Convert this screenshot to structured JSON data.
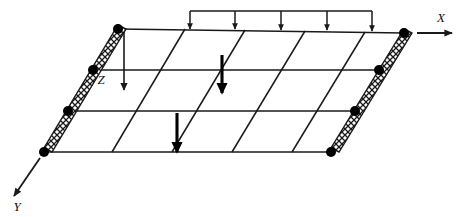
{
  "figure": {
    "background_color": "#ffffff",
    "line_color": "#1a1a1a",
    "node_color": "#000000"
  },
  "axes": [
    {
      "name": "x-axis",
      "label": "X",
      "label_x": 441,
      "label_y": 22,
      "arrow_from": [
        417,
        33
      ],
      "arrow_to": [
        452,
        33
      ],
      "direction": "right"
    },
    {
      "name": "y-axis",
      "label": "Y",
      "label_x": 17,
      "label_y": 211,
      "arrow_from": [
        40,
        158
      ],
      "arrow_to": [
        14,
        196
      ],
      "direction": "down-left"
    },
    {
      "name": "z-axis",
      "label": "Z",
      "label_x": 101,
      "label_y": 84,
      "arrow_from": [
        124,
        32
      ],
      "arrow_to": [
        124,
        90
      ],
      "direction": "down"
    }
  ],
  "slab": {
    "name": "skew-slab-outline",
    "corners": {
      "top_left": [
        118,
        29
      ],
      "top_right": [
        404,
        33
      ],
      "bottom_right": [
        331,
        152
      ],
      "bottom_left": [
        44,
        152
      ]
    },
    "horizontal_lines_y": [
      29,
      70,
      111,
      152
    ],
    "horizontal_lines_count": 4,
    "oblique_lines_count": 4,
    "oblique_top_x": [
      185,
      245,
      305,
      365
    ],
    "oblique_bottom_x": [
      112,
      172,
      232,
      292
    ],
    "skew_offset_px": 73
  },
  "supports": [
    {
      "name": "left-support-edge",
      "type": "hatched-simple-support",
      "from": [
        118,
        29
      ],
      "to": [
        44,
        152
      ],
      "hatch_pattern": "cross-hatch",
      "band_width": 9
    },
    {
      "name": "right-support-edge",
      "type": "hatched-simple-support",
      "from": [
        404,
        33
      ],
      "to": [
        331,
        152
      ],
      "hatch_pattern": "cross-hatch",
      "band_width": 9
    }
  ],
  "nodes": {
    "name": "support-nodes",
    "radius": 5,
    "left_edge": [
      [
        118,
        29
      ],
      [
        93,
        70
      ],
      [
        68,
        111
      ],
      [
        44,
        152
      ]
    ],
    "right_edge": [
      [
        404,
        33
      ],
      [
        379,
        70
      ],
      [
        355,
        111
      ],
      [
        331,
        152
      ]
    ]
  },
  "loads": {
    "distributed": {
      "name": "distributed-load-top-edge",
      "rail_y": 11,
      "rail_from_x": 190,
      "rail_to_x": 372,
      "arrow_count": 5,
      "arrow_x": [
        190,
        235,
        281,
        327,
        372
      ],
      "arrow_tip_y": 30,
      "arrow_top_y": 11
    },
    "concentrated": [
      {
        "name": "point-load-upper",
        "x": 222,
        "from_y": 55,
        "to_y": 93
      },
      {
        "name": "point-load-lower",
        "x": 177,
        "from_y": 113,
        "to_y": 152
      }
    ]
  }
}
